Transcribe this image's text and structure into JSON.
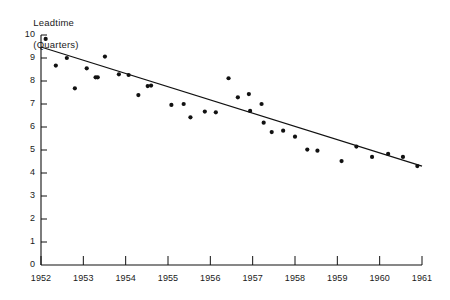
{
  "chart_data": {
    "type": "scatter",
    "title": "",
    "ylabel_line1": "Leadtime",
    "ylabel_line2": "(Quarters)",
    "xlabel": "",
    "xlim": [
      1952,
      1961
    ],
    "ylim": [
      0,
      10
    ],
    "grid": false,
    "legend": null,
    "ytick_labels": [
      "0",
      "1",
      "2",
      "3",
      "4",
      "5",
      "6",
      "7",
      "8",
      "9",
      "10"
    ],
    "yticks": [
      0,
      1,
      2,
      3,
      4,
      5,
      6,
      7,
      8,
      9,
      10
    ],
    "xtick_labels": [
      "1952",
      "1953",
      "1954",
      "1955",
      "1956",
      "1957",
      "1958",
      "1959",
      "1960",
      "1961"
    ],
    "xticks": [
      1952,
      1953,
      1954,
      1955,
      1956,
      1957,
      1958,
      1959,
      1960,
      1961
    ],
    "marker": "filled-circle",
    "marker_color": "#111111",
    "line_color": "#111111",
    "points": [
      {
        "x": 1952.11,
        "y": 9.83
      },
      {
        "x": 1952.35,
        "y": 8.67
      },
      {
        "x": 1952.61,
        "y": 9.0
      },
      {
        "x": 1952.8,
        "y": 7.68
      },
      {
        "x": 1953.08,
        "y": 8.55
      },
      {
        "x": 1953.29,
        "y": 8.16
      },
      {
        "x": 1953.51,
        "y": 9.06
      },
      {
        "x": 1953.34,
        "y": 8.16
      },
      {
        "x": 1953.84,
        "y": 8.29
      },
      {
        "x": 1954.07,
        "y": 8.26
      },
      {
        "x": 1954.3,
        "y": 7.39
      },
      {
        "x": 1954.6,
        "y": 7.8
      },
      {
        "x": 1954.52,
        "y": 7.78
      },
      {
        "x": 1955.08,
        "y": 6.96
      },
      {
        "x": 1955.37,
        "y": 7.0
      },
      {
        "x": 1955.53,
        "y": 6.42
      },
      {
        "x": 1955.87,
        "y": 6.67
      },
      {
        "x": 1956.13,
        "y": 6.64
      },
      {
        "x": 1956.43,
        "y": 8.12
      },
      {
        "x": 1956.65,
        "y": 7.29
      },
      {
        "x": 1956.91,
        "y": 7.43
      },
      {
        "x": 1956.94,
        "y": 6.7
      },
      {
        "x": 1957.26,
        "y": 6.19
      },
      {
        "x": 1957.21,
        "y": 7.0
      },
      {
        "x": 1957.72,
        "y": 5.84
      },
      {
        "x": 1957.45,
        "y": 5.78
      },
      {
        "x": 1958.0,
        "y": 5.58
      },
      {
        "x": 1958.29,
        "y": 5.02
      },
      {
        "x": 1958.53,
        "y": 4.97
      },
      {
        "x": 1959.1,
        "y": 4.52
      },
      {
        "x": 1959.45,
        "y": 5.15
      },
      {
        "x": 1959.82,
        "y": 4.7
      },
      {
        "x": 1960.2,
        "y": 4.83
      },
      {
        "x": 1960.55,
        "y": 4.7
      },
      {
        "x": 1960.89,
        "y": 4.3
      }
    ],
    "trend_line": {
      "x_start": 1952.0,
      "y_start": 9.48,
      "x_end": 1961.0,
      "y_end": 4.3
    }
  }
}
